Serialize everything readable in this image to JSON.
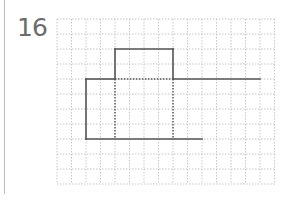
{
  "problem": {
    "number": "16"
  },
  "grid": {
    "origin_x": 57,
    "origin_y": 19,
    "cell_w": 14.5,
    "cell_h": 15,
    "cols": 15,
    "rows": 11,
    "line_color": "#c8c8c8"
  },
  "figure": {
    "stroke_color": "#555555",
    "solid_segments": [
      {
        "from": [
          2,
          4
        ],
        "to": [
          2,
          8
        ]
      },
      {
        "from": [
          2,
          8
        ],
        "to": [
          10,
          8
        ]
      },
      {
        "from": [
          2,
          4
        ],
        "to": [
          4,
          4
        ]
      },
      {
        "from": [
          4,
          4
        ],
        "to": [
          4,
          2
        ]
      },
      {
        "from": [
          4,
          2
        ],
        "to": [
          8,
          2
        ]
      },
      {
        "from": [
          8,
          2
        ],
        "to": [
          8,
          4
        ]
      },
      {
        "from": [
          8,
          4
        ],
        "to": [
          14,
          4
        ]
      }
    ],
    "dotted_segments": [
      {
        "from": [
          4,
          4
        ],
        "to": [
          8,
          4
        ]
      },
      {
        "from": [
          4,
          4
        ],
        "to": [
          4,
          8
        ]
      },
      {
        "from": [
          8,
          4
        ],
        "to": [
          8,
          8
        ]
      }
    ]
  }
}
